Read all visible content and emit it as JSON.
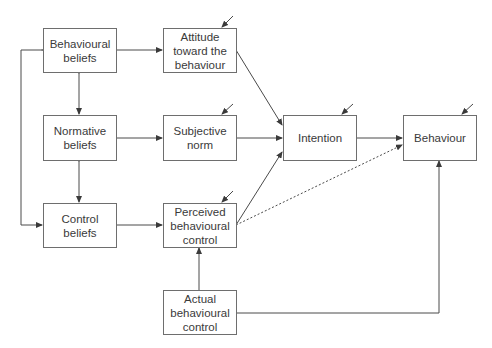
{
  "diagram": {
    "nodes": [
      {
        "id": "behavioural_beliefs",
        "label": "Behavioural\nbeliefs"
      },
      {
        "id": "normative_beliefs",
        "label": "Normative\nbeliefs"
      },
      {
        "id": "control_beliefs",
        "label": "Control\nbeliefs"
      },
      {
        "id": "attitude",
        "label": "Attitude\ntoward the\nbehaviour"
      },
      {
        "id": "subjective_norm",
        "label": "Subjective\nnorm"
      },
      {
        "id": "perceived_control",
        "label": "Perceived\nbehavioural\ncontrol"
      },
      {
        "id": "actual_control",
        "label": "Actual\nbehavioural\ncontrol"
      },
      {
        "id": "intention",
        "label": "Intention"
      },
      {
        "id": "behaviour",
        "label": "Behaviour"
      }
    ],
    "edges": [
      {
        "from": "behavioural_beliefs",
        "to": "attitude",
        "style": "solid"
      },
      {
        "from": "normative_beliefs",
        "to": "subjective_norm",
        "style": "solid"
      },
      {
        "from": "control_beliefs",
        "to": "perceived_control",
        "style": "solid"
      },
      {
        "from": "behavioural_beliefs",
        "to": "normative_beliefs",
        "style": "solid",
        "bidirectional": true
      },
      {
        "from": "normative_beliefs",
        "to": "control_beliefs",
        "style": "solid",
        "bidirectional": true
      },
      {
        "from": "behavioural_beliefs",
        "to": "control_beliefs",
        "style": "solid",
        "bidirectional": true,
        "route": "left-bracket"
      },
      {
        "from": "attitude",
        "to": "intention",
        "style": "solid"
      },
      {
        "from": "subjective_norm",
        "to": "intention",
        "style": "solid"
      },
      {
        "from": "perceived_control",
        "to": "intention",
        "style": "solid"
      },
      {
        "from": "perceived_control",
        "to": "behaviour",
        "style": "dotted"
      },
      {
        "from": "intention",
        "to": "behaviour",
        "style": "solid"
      },
      {
        "from": "actual_control",
        "to": "perceived_control",
        "style": "solid"
      },
      {
        "from": "actual_control",
        "to": "behaviour",
        "style": "solid"
      }
    ],
    "error_arrows_on": [
      "attitude",
      "subjective_norm",
      "perceived_control",
      "intention",
      "behaviour"
    ],
    "colors": {
      "line": "#4a4a4a",
      "border": "#6e6e6e",
      "text": "#3a3a3a",
      "background": "#ffffff"
    }
  }
}
